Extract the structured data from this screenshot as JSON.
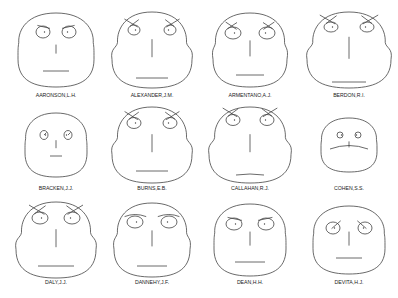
{
  "chart_data": {
    "type": "chernoff_faces",
    "title": "",
    "layout": {
      "rows": 3,
      "cols": 4
    },
    "faces": [
      {
        "label": "AARONSON,L.H.",
        "cx": 56,
        "cy": 50,
        "head_w": 38,
        "head_h": 37,
        "cheek": 0,
        "eye_dy": -18,
        "eye_dx": 13,
        "eye_rx": 7,
        "eye_ry": 6,
        "pupil_dx": 0,
        "brow": "in",
        "brow_len": 9,
        "nose": 9,
        "mouth_y": 21,
        "mouth_w": 26,
        "mouth_curve": 0
      },
      {
        "label": "ALEXANDER,J.M.",
        "cx": 152,
        "cy": 50,
        "head_w": 40,
        "head_h": 38,
        "cheek": 1,
        "eye_dy": -20,
        "eye_dx": 18,
        "eye_rx": 6,
        "eye_ry": 5,
        "pupil_dx": 0,
        "brow": "cross",
        "brow_len": 12,
        "nose": 18,
        "mouth_y": 28,
        "mouth_w": 32,
        "mouth_curve": 0
      },
      {
        "label": "ARMENTANO,A.J.",
        "cx": 250,
        "cy": 50,
        "head_w": 37,
        "head_h": 37,
        "cheek": 0.4,
        "eye_dy": -17,
        "eye_dx": 17,
        "eye_rx": 8,
        "eye_ry": 6,
        "pupil_dx": 0,
        "brow": "cross",
        "brow_len": 10,
        "nose": 16,
        "mouth_y": 25,
        "mouth_w": 28,
        "mouth_curve": 0
      },
      {
        "label": "BERDON,R.I.",
        "cx": 349,
        "cy": 50,
        "head_w": 42,
        "head_h": 38,
        "cheek": 1,
        "eye_dy": -23,
        "eye_dx": 18,
        "eye_rx": 7,
        "eye_ry": 5,
        "pupil_dx": 0,
        "brow": "cross",
        "brow_len": 14,
        "nose": 22,
        "mouth_y": 32,
        "mouth_w": 34,
        "mouth_curve": 0
      },
      {
        "label": "BRACKEN,J.J.",
        "cx": 56,
        "cy": 145,
        "head_w": 31,
        "head_h": 32,
        "cheek": 0,
        "eye_dy": -10,
        "eye_dx": 12,
        "eye_rx": 4,
        "eye_ry": 4.5,
        "pupil_dx": 2,
        "brow": "none",
        "brow_len": 0,
        "nose": 8,
        "mouth_y": 11,
        "mouth_w": 12,
        "mouth_curve": 0
      },
      {
        "label": "BURNS,E.B.",
        "cx": 152,
        "cy": 145,
        "head_w": 40,
        "head_h": 38,
        "cheek": 1,
        "eye_dy": -22,
        "eye_dx": 18,
        "eye_rx": 7,
        "eye_ry": 5.5,
        "pupil_dx": 0,
        "brow": "cross",
        "brow_len": 12,
        "nose": 18,
        "mouth_y": 26,
        "mouth_w": 32,
        "mouth_curve": 0
      },
      {
        "label": "CALLAHAN,R.J.",
        "cx": 250,
        "cy": 145,
        "head_w": 41,
        "head_h": 38,
        "cheek": 1,
        "eye_dy": -25,
        "eye_dx": 17,
        "eye_rx": 7,
        "eye_ry": 5.5,
        "pupil_dx": 0,
        "brow": "cross",
        "brow_len": 13,
        "nose": 18,
        "mouth_y": 30,
        "mouth_w": 28,
        "mouth_curve": 1
      },
      {
        "label": "COHEN,S.S.",
        "cx": 349,
        "cy": 145,
        "head_w": 28,
        "head_h": 27,
        "cheek": 0,
        "eye_dy": -10,
        "eye_dx": 9,
        "eye_rx": 3,
        "eye_ry": 3,
        "pupil_dx": 0,
        "brow": "none",
        "brow_len": 0,
        "nose": 6,
        "mouth_y": 1,
        "mouth_w": 38,
        "mouth_curve": -3
      },
      {
        "label": "DALY,J.J.",
        "cx": 56,
        "cy": 240,
        "head_w": 40,
        "head_h": 38,
        "cheek": 1,
        "eye_dy": -22,
        "eye_dx": 16,
        "eye_rx": 8,
        "eye_ry": 6,
        "pupil_dx": 0,
        "brow": "cross",
        "brow_len": 14,
        "nose": 18,
        "mouth_y": 26,
        "mouth_w": 36,
        "mouth_curve": 0
      },
      {
        "label": "DANNEHY,J.F.",
        "cx": 152,
        "cy": 240,
        "head_w": 38,
        "head_h": 37,
        "cheek": 0.6,
        "eye_dy": -18,
        "eye_dx": 17,
        "eye_rx": 8,
        "eye_ry": 6,
        "pupil_dx": 0,
        "brow": "flat",
        "brow_len": 12,
        "nose": 16,
        "mouth_y": 26,
        "mouth_w": 30,
        "mouth_curve": 0
      },
      {
        "label": "DEAN,H.H.",
        "cx": 250,
        "cy": 240,
        "head_w": 36,
        "head_h": 36,
        "cheek": 0,
        "eye_dy": -16,
        "eye_dx": 16,
        "eye_rx": 8,
        "eye_ry": 6,
        "pupil_dx": 0,
        "brow": "in",
        "brow_len": 10,
        "nose": 14,
        "mouth_y": 22,
        "mouth_w": 30,
        "mouth_curve": 0
      },
      {
        "label": "DEVITA,H.J.",
        "cx": 349,
        "cy": 240,
        "head_w": 36,
        "head_h": 34,
        "cheek": 0,
        "eye_dy": -12,
        "eye_dx": 16,
        "eye_rx": 7,
        "eye_ry": 6,
        "pupil_dx": 0,
        "brow": "diag",
        "brow_len": 10,
        "nose": 14,
        "mouth_y": 18,
        "mouth_w": 26,
        "mouth_curve": 0
      }
    ],
    "xlabel": "",
    "ylabel": ""
  }
}
